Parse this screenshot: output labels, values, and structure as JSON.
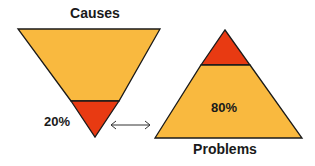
{
  "diagram": {
    "title_left": "Causes",
    "title_right": "Problems",
    "left_label": "20%",
    "right_label": "80%",
    "colors": {
      "main_fill": "#F9B93F",
      "highlight_fill": "#E83A12",
      "stroke": "#1a1a1a",
      "arrow": "#333333"
    },
    "connector": "double-headed arrow linking the 20% of causes to the 80% of problems"
  }
}
